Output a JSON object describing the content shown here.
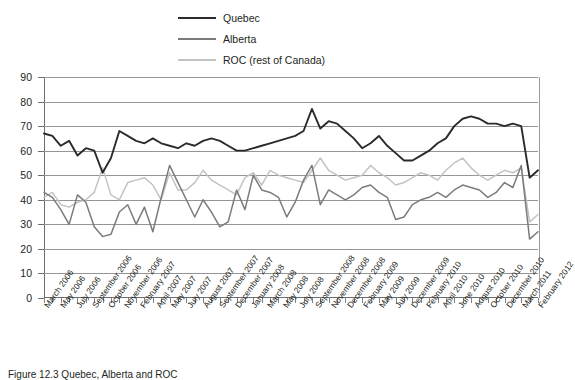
{
  "chart_data": {
    "type": "line",
    "title": "",
    "xlabel": "",
    "ylabel": "",
    "ylim": [
      0,
      90
    ],
    "ytick_step": 10,
    "yticks": [
      90,
      80,
      70,
      60,
      50,
      40,
      30,
      20,
      10,
      0
    ],
    "grid": true,
    "legend_position": "top-center",
    "categories": [
      "March 2006",
      "May 2006",
      "July 2006",
      "September 2006",
      "October 2006",
      "November 2006",
      "February 2007",
      "April 2007",
      "May 2007",
      "July 2007",
      "August 2007",
      "September 2007",
      "December 2007",
      "January 2008",
      "March 2008",
      "May 2008",
      "July 2008",
      "September 2008",
      "November 2008",
      "December 2008",
      "February 2009",
      "May 2009",
      "July 2009",
      "December 2009",
      "February 2010",
      "April 2010",
      "June 2010",
      "August 2010",
      "October 2010",
      "December 2010",
      "March 2011",
      "February 2012"
    ],
    "series": [
      {
        "name": "Quebec",
        "color": "#2b2b2b",
        "values": [
          67,
          66,
          62,
          64,
          58,
          61,
          51,
          57,
          68,
          66,
          64,
          65,
          62,
          63,
          64,
          64,
          60,
          59,
          61,
          61,
          62,
          63,
          64,
          63,
          62,
          62,
          64,
          65,
          63,
          62,
          66,
          63
        ]
      },
      {
        "name": "Alberta",
        "color": "#7b7b7b",
        "values": [
          43,
          41,
          37,
          34,
          30,
          39,
          25,
          25,
          34,
          38,
          30,
          38,
          27,
          41,
          54,
          47,
          40,
          35,
          36,
          41,
          40,
          41,
          44,
          44,
          43,
          50,
          48,
          46,
          41,
          40,
          38,
          36
        ]
      },
      {
        "name": "ROC (rest of Canada)",
        "color": "#c3c3c3",
        "values": [
          41,
          43,
          38,
          39,
          40,
          41,
          53,
          43,
          41,
          48,
          49,
          47,
          42,
          47,
          52,
          45,
          46,
          44,
          48,
          46,
          47,
          46,
          48,
          50,
          49,
          51,
          50,
          53,
          51,
          49,
          50,
          48
        ]
      }
    ],
    "series_extended": {
      "note": "Full month-by-month sampling read off the plotted polylines (approximately 60 points per series).",
      "x_count": 60,
      "quebec": [
        67,
        66,
        62,
        64,
        58,
        61,
        60,
        51,
        57,
        68,
        66,
        64,
        63,
        65,
        63,
        62,
        61,
        63,
        62,
        64,
        65,
        64,
        62,
        60,
        60,
        61,
        62,
        63,
        64,
        65,
        66,
        68,
        77,
        69,
        72,
        71,
        68,
        65,
        61,
        63,
        66,
        62,
        59,
        56,
        56,
        58,
        60,
        63,
        65,
        70,
        73,
        74,
        73,
        71,
        71,
        70,
        71,
        70,
        49,
        52
      ],
      "alberta": [
        43,
        41,
        36,
        30,
        42,
        39,
        29,
        25,
        26,
        35,
        38,
        30,
        37,
        27,
        41,
        54,
        47,
        40,
        33,
        40,
        35,
        29,
        31,
        44,
        36,
        50,
        44,
        43,
        41,
        33,
        39,
        48,
        54,
        38,
        44,
        42,
        40,
        42,
        45,
        46,
        43,
        41,
        32,
        33,
        38,
        40,
        41,
        43,
        41,
        44,
        46,
        45,
        44,
        41,
        43,
        47,
        45,
        54,
        24,
        27
      ],
      "roc": [
        41,
        43,
        38,
        37,
        39,
        40,
        43,
        53,
        42,
        40,
        47,
        48,
        49,
        46,
        40,
        51,
        44,
        44,
        47,
        52,
        48,
        46,
        44,
        42,
        49,
        51,
        46,
        52,
        50,
        49,
        48,
        47,
        52,
        57,
        52,
        50,
        48,
        49,
        50,
        54,
        51,
        49,
        46,
        47,
        49,
        51,
        50,
        48,
        52,
        55,
        57,
        53,
        50,
        48,
        50,
        52,
        51,
        53,
        31,
        34
      ]
    }
  },
  "legend": {
    "items": [
      {
        "label": "Quebec",
        "color": "#2b2b2b",
        "thickness": "2.6px"
      },
      {
        "label": "Alberta",
        "color": "#7b7b7b",
        "thickness": "2.0px"
      },
      {
        "label": "ROC (rest of Canada)",
        "color": "#c3c3c3",
        "thickness": "2.0px"
      }
    ]
  },
  "caption": {
    "text": "Figure 12.3  Quebec, Alberta and ROC"
  }
}
